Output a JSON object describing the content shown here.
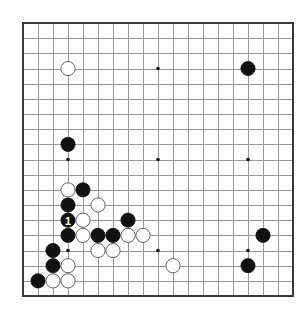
{
  "board": {
    "size": 19,
    "origin_x": 23,
    "origin_y": 23,
    "spacing_x": 15,
    "spacing_y": 15.17,
    "stone_diameter": 14.2,
    "colors": {
      "background": "#ffffff",
      "grid": "#9a9a9a",
      "border": "#3a3a3a",
      "black_stone": "#111111",
      "white_stone_fill": "#ffffff",
      "white_stone_outline": "#555555"
    },
    "star_points": [
      [
        3,
        3
      ],
      [
        9,
        3
      ],
      [
        15,
        3
      ],
      [
        3,
        9
      ],
      [
        9,
        9
      ],
      [
        15,
        9
      ],
      [
        3,
        15
      ],
      [
        9,
        15
      ],
      [
        15,
        15
      ]
    ]
  },
  "stones": {
    "black": [
      [
        15,
        3
      ],
      [
        3,
        8
      ],
      [
        4,
        11
      ],
      [
        3,
        12
      ],
      [
        3,
        13
      ],
      [
        7,
        13
      ],
      [
        3,
        14
      ],
      [
        5,
        14
      ],
      [
        6,
        14
      ],
      [
        16,
        14
      ],
      [
        2,
        15
      ],
      [
        2,
        16
      ],
      [
        15,
        16
      ],
      [
        1,
        17
      ]
    ],
    "white": [
      [
        3,
        3
      ],
      [
        3,
        11
      ],
      [
        5,
        12
      ],
      [
        4,
        13
      ],
      [
        4,
        14
      ],
      [
        7,
        14
      ],
      [
        8,
        14
      ],
      [
        5,
        15
      ],
      [
        6,
        15
      ],
      [
        3,
        16
      ],
      [
        10,
        16
      ],
      [
        2,
        17
      ],
      [
        3,
        17
      ]
    ]
  },
  "labels": [
    {
      "col": 3,
      "row": 13,
      "text": "1",
      "on": "black"
    }
  ]
}
